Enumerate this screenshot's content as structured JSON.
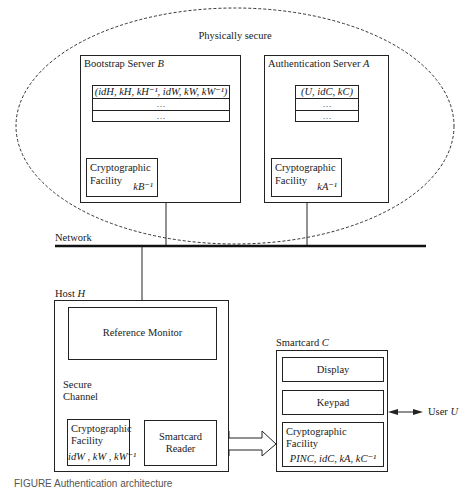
{
  "diagram": {
    "secure_zone": {
      "label": "Physically secure"
    },
    "bootstrap_server": {
      "title": "Bootstrap Server",
      "title_var": "B",
      "table_rows": [
        "(id_H, k_H, k_H^-1, id_W, k_W, k_W^-1)",
        "…",
        "…"
      ],
      "table_row0_display": "(idH, kH, kH⁻¹, idW, kW, kW⁻¹)",
      "crypto": {
        "label_line1": "Cryptographic",
        "label_line2": "Facility",
        "key": "kB⁻¹"
      }
    },
    "auth_server": {
      "title": "Authentication Server",
      "title_var": "A",
      "table_rows": [
        "(U, id_C, k_C)",
        "…",
        "…"
      ],
      "table_row0_display": "(U, idC, kC)",
      "crypto": {
        "label_line1": "Cryptographic",
        "label_line2": "Facility",
        "key": "kA⁻¹"
      }
    },
    "network": {
      "label": "Network"
    },
    "host": {
      "title": "Host",
      "title_var": "H",
      "reference_monitor": "Reference Monitor",
      "secure_channel": {
        "line1": "Secure",
        "line2": "Channel"
      },
      "crypto": {
        "label_line1": "Cryptographic",
        "label_line2": "Facility",
        "keys": "idW , kW , kW⁻¹"
      },
      "smartcard_reader": {
        "line1": "Smartcard",
        "line2": "Reader"
      }
    },
    "smartcard": {
      "title": "Smartcard",
      "title_var": "C",
      "display": "Display",
      "keypad": "Keypad",
      "crypto": {
        "label_line1": "Cryptographic",
        "label_line2": "Facility",
        "keys": "PINC, idC, kA, kC⁻¹"
      }
    },
    "user": {
      "label": "User",
      "label_var": "U"
    },
    "caption": "FIGURE  Authentication architecture"
  }
}
